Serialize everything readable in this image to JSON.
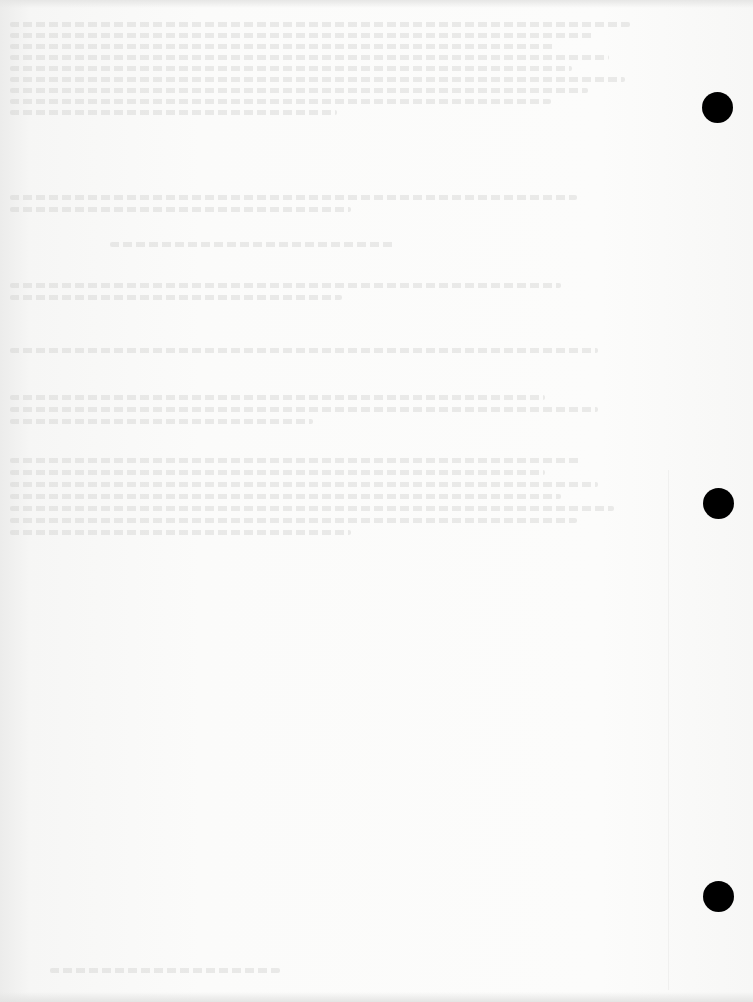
{
  "document": {
    "type": "scanned blank page with bleed-through",
    "text": "",
    "bleed_through_blocks": [
      {
        "top": 22,
        "lines": 9,
        "left": 10,
        "width": 620,
        "spacing": 11
      },
      {
        "top": 195,
        "lines": 2,
        "left": 10,
        "width": 620,
        "spacing": 12
      },
      {
        "top": 242,
        "lines": 1,
        "left": 110,
        "width": 300,
        "spacing": 12
      },
      {
        "top": 283,
        "lines": 2,
        "left": 10,
        "width": 620,
        "spacing": 12
      },
      {
        "top": 348,
        "lines": 1,
        "left": 10,
        "width": 620,
        "spacing": 12
      },
      {
        "top": 395,
        "lines": 3,
        "left": 10,
        "width": 620,
        "spacing": 12
      },
      {
        "top": 458,
        "lines": 7,
        "left": 10,
        "width": 620,
        "spacing": 12
      }
    ],
    "footer_bleed": {
      "top": 968,
      "left": 50,
      "width": 230
    }
  },
  "binder_holes": [
    {
      "cx": 717,
      "cy": 107,
      "diameter": 31
    },
    {
      "cx": 718,
      "cy": 503,
      "diameter": 31
    },
    {
      "cx": 718,
      "cy": 896,
      "diameter": 31
    }
  ],
  "colors": {
    "paper": "#fbfbfa",
    "hole": "#000000",
    "bleed": "#c8c8c6"
  }
}
